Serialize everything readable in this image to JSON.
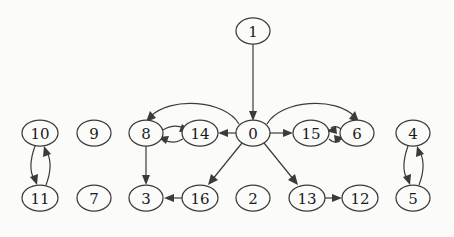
{
  "diagram": {
    "type": "directed-graph",
    "title": "",
    "background_color": "#fbfbfa",
    "node_fill_color": "#fbfbfa",
    "node_stroke_color": "#3b3b3b",
    "edge_color": "#3b3b3b",
    "node_shape": "ellipse",
    "node_count": 17,
    "edge_count": 18,
    "nodes": [
      {
        "id": "1",
        "label": "1",
        "x": 253,
        "y": 31,
        "rx": 17,
        "ry": 13
      },
      {
        "id": "10",
        "label": "10",
        "x": 40,
        "y": 133,
        "rx": 18,
        "ry": 13
      },
      {
        "id": "9",
        "label": "9",
        "x": 94,
        "y": 133,
        "rx": 17,
        "ry": 13
      },
      {
        "id": "8",
        "label": "8",
        "x": 146,
        "y": 133,
        "rx": 17,
        "ry": 13
      },
      {
        "id": "14",
        "label": "14",
        "x": 200,
        "y": 133,
        "rx": 18,
        "ry": 13
      },
      {
        "id": "0",
        "label": "0",
        "x": 253,
        "y": 133,
        "rx": 17,
        "ry": 13
      },
      {
        "id": "15",
        "label": "15",
        "x": 311,
        "y": 133,
        "rx": 18,
        "ry": 13
      },
      {
        "id": "6",
        "label": "6",
        "x": 357,
        "y": 133,
        "rx": 17,
        "ry": 13
      },
      {
        "id": "4",
        "label": "4",
        "x": 413,
        "y": 133,
        "rx": 17,
        "ry": 13
      },
      {
        "id": "11",
        "label": "11",
        "x": 40,
        "y": 198,
        "rx": 18,
        "ry": 13
      },
      {
        "id": "7",
        "label": "7",
        "x": 94,
        "y": 198,
        "rx": 17,
        "ry": 13
      },
      {
        "id": "3",
        "label": "3",
        "x": 146,
        "y": 198,
        "rx": 17,
        "ry": 13
      },
      {
        "id": "16",
        "label": "16",
        "x": 200,
        "y": 198,
        "rx": 18,
        "ry": 13
      },
      {
        "id": "2",
        "label": "2",
        "x": 253,
        "y": 198,
        "rx": 17,
        "ry": 13
      },
      {
        "id": "13",
        "label": "13",
        "x": 307,
        "y": 198,
        "rx": 18,
        "ry": 13
      },
      {
        "id": "12",
        "label": "12",
        "x": 360,
        "y": 198,
        "rx": 18,
        "ry": 13
      },
      {
        "id": "5",
        "label": "5",
        "x": 413,
        "y": 198,
        "rx": 17,
        "ry": 13
      }
    ],
    "edges": [
      {
        "from": "1",
        "to": "0",
        "style": "straight"
      },
      {
        "from": "0",
        "to": "8",
        "style": "arc-over"
      },
      {
        "from": "0",
        "to": "14",
        "style": "straight"
      },
      {
        "from": "0",
        "to": "15",
        "style": "straight"
      },
      {
        "from": "0",
        "to": "6",
        "style": "arc-over"
      },
      {
        "from": "0",
        "to": "16",
        "style": "straight"
      },
      {
        "from": "0",
        "to": "13",
        "style": "straight"
      },
      {
        "from": "8",
        "to": "14",
        "style": "curve-upper"
      },
      {
        "from": "14",
        "to": "8",
        "style": "curve-lower"
      },
      {
        "from": "15",
        "to": "6",
        "style": "curve-lower"
      },
      {
        "from": "6",
        "to": "15",
        "style": "curve-upper"
      },
      {
        "from": "8",
        "to": "3",
        "style": "straight"
      },
      {
        "from": "16",
        "to": "3",
        "style": "straight"
      },
      {
        "from": "13",
        "to": "12",
        "style": "straight"
      },
      {
        "from": "10",
        "to": "11",
        "style": "curve-left"
      },
      {
        "from": "11",
        "to": "10",
        "style": "curve-right"
      },
      {
        "from": "4",
        "to": "5",
        "style": "curve-left"
      },
      {
        "from": "5",
        "to": "4",
        "style": "curve-right"
      }
    ],
    "isolated_nodes": [
      "9",
      "7",
      "2"
    ]
  }
}
